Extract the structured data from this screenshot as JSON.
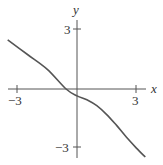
{
  "chart_data": {
    "type": "line",
    "title": "",
    "xlabel": "x",
    "ylabel": "y",
    "xlim": [
      -3.9,
      4.0
    ],
    "ylim": [
      -3.7,
      4.3
    ],
    "x_ticks": [
      -3,
      3
    ],
    "y_ticks": [
      3,
      -3
    ],
    "x_tick_labels": [
      "−3",
      "3"
    ],
    "y_tick_labels": [
      "3",
      "−3"
    ],
    "grid": false,
    "legend": false,
    "series": [
      {
        "name": "curve",
        "x": [
          -3.5,
          -2.5,
          -1.5,
          -0.55,
          0,
          0.5,
          1.0,
          1.5,
          2.0,
          2.5,
          3.0,
          3.45
        ],
        "y": [
          2.5,
          1.75,
          1.0,
          0.0,
          -0.35,
          -0.55,
          -0.85,
          -1.3,
          -1.85,
          -2.45,
          -3.0,
          -3.45
        ]
      }
    ]
  }
}
